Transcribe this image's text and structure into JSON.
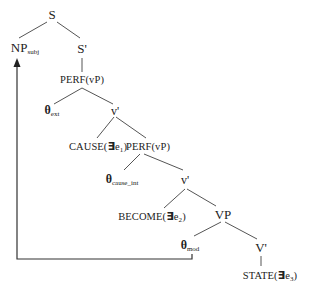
{
  "diagram": {
    "type": "syntax-tree",
    "nodes": {
      "s": {
        "label": "S"
      },
      "np_subj": {
        "label": "NP",
        "sub": "subj"
      },
      "s_bar": {
        "label": "S'"
      },
      "perf_vp_1": {
        "label": "PERF(vP)"
      },
      "theta_ext": {
        "label": "θ",
        "sub": "ext"
      },
      "v_bar_1": {
        "label": "v'"
      },
      "cause": {
        "label_pre": "CAUSE(",
        "exists": "∃",
        "var": "e",
        "sub": "1",
        "label_post": ")"
      },
      "perf_vp_2": {
        "label": "PERF(vP)"
      },
      "theta_cause_int": {
        "label": "θ",
        "sub": "cause_int"
      },
      "v_bar_2": {
        "label": "v'"
      },
      "become": {
        "label_pre": "BECOME(",
        "exists": "∃",
        "var": "e",
        "sub": "2",
        "label_post": ")"
      },
      "vp": {
        "label": "VP"
      },
      "theta_mod": {
        "label": "θ",
        "sub": "mod"
      },
      "v_bar_big": {
        "label": "V'"
      },
      "state": {
        "label_pre": "STATE(",
        "exists": "∃",
        "var": "e",
        "sub": "3",
        "label_post": ")"
      }
    },
    "edges": [
      [
        "s",
        "np_subj"
      ],
      [
        "s",
        "s_bar"
      ],
      [
        "s_bar",
        "perf_vp_1"
      ],
      [
        "perf_vp_1",
        "theta_ext"
      ],
      [
        "perf_vp_1",
        "v_bar_1"
      ],
      [
        "v_bar_1",
        "cause"
      ],
      [
        "v_bar_1",
        "perf_vp_2"
      ],
      [
        "perf_vp_2",
        "theta_cause_int"
      ],
      [
        "perf_vp_2",
        "v_bar_2"
      ],
      [
        "v_bar_2",
        "become"
      ],
      [
        "v_bar_2",
        "vp"
      ],
      [
        "vp",
        "theta_mod"
      ],
      [
        "vp",
        "v_bar_big"
      ],
      [
        "v_bar_big",
        "state"
      ]
    ],
    "movement_arrow": {
      "from": "theta_mod",
      "to": "np_subj"
    },
    "colors": {
      "line": "#444444",
      "text": "#222222",
      "background": "#ffffff"
    }
  }
}
